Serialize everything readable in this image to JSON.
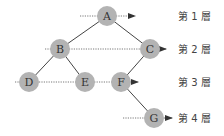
{
  "diagram": {
    "type": "binary-tree-level-order",
    "colors": {
      "node_fill": "#b3b3b3",
      "edge": "#444444",
      "dotted_line": "#555555",
      "text": "#333333"
    },
    "nodes": [
      {
        "id": "A",
        "label": "A",
        "x": 107,
        "y": 16
      },
      {
        "id": "B",
        "label": "B",
        "x": 60,
        "y": 49
      },
      {
        "id": "C",
        "label": "C",
        "x": 150,
        "y": 49
      },
      {
        "id": "D",
        "label": "D",
        "x": 29,
        "y": 82
      },
      {
        "id": "E",
        "label": "E",
        "x": 85,
        "y": 82
      },
      {
        "id": "F",
        "label": "F",
        "x": 121,
        "y": 82
      },
      {
        "id": "G",
        "label": "G",
        "x": 154,
        "y": 118
      }
    ],
    "edges": [
      {
        "from": "A",
        "to": "B"
      },
      {
        "from": "A",
        "to": "C"
      },
      {
        "from": "B",
        "to": "D"
      },
      {
        "from": "B",
        "to": "E"
      },
      {
        "from": "C",
        "to": "F"
      },
      {
        "from": "F",
        "to": "G"
      }
    ],
    "levels": [
      {
        "label": "第 1 層",
        "y": 16,
        "line_x1": 80,
        "line_x2": 135
      },
      {
        "label": "第 2 層",
        "y": 49,
        "line_x1": 45,
        "line_x2": 166
      },
      {
        "label": "第 3 層",
        "y": 82,
        "line_x1": 15,
        "line_x2": 138
      },
      {
        "label": "第 4 層",
        "y": 118,
        "line_x1": 123,
        "line_x2": 172
      }
    ]
  }
}
